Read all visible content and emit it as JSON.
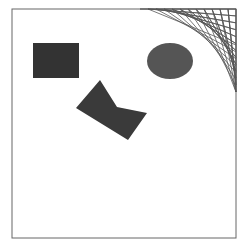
{
  "figure": {
    "frame": {
      "x": 12,
      "y": 9,
      "width": 224,
      "height": 229,
      "stroke": "#666666"
    },
    "shapes": {
      "rectangle": {
        "x": 33,
        "y": 43,
        "width": 46,
        "height": 35,
        "fill": "#333333"
      },
      "ellipse": {
        "cx": 170,
        "cy": 61,
        "rx": 23,
        "ry": 18,
        "fill": "#555555"
      },
      "polygon": {
        "points": "100,80 117,107 147,113 128,140 76,108",
        "fill": "#3a3a3a"
      }
    },
    "curve_stitch": {
      "corner": "top-right",
      "line_color": "#555555",
      "line_count": 12
    },
    "caption": ""
  }
}
